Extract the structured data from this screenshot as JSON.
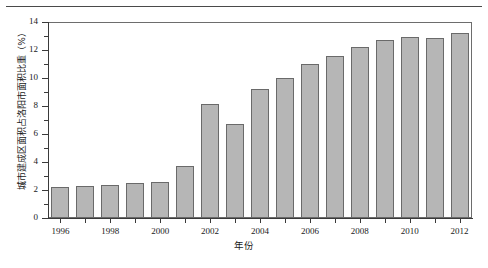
{
  "chart_data": {
    "type": "bar",
    "title": "",
    "xlabel": "年份",
    "ylabel": "城市建成区面积占洛阳市面积比重（%）",
    "categories": [
      1996,
      1997,
      1998,
      1999,
      2000,
      2001,
      2002,
      2003,
      2004,
      2005,
      2006,
      2007,
      2008,
      2009,
      2010,
      2011,
      2012
    ],
    "values": [
      2.25,
      2.3,
      2.35,
      2.5,
      2.55,
      3.7,
      8.15,
      6.75,
      9.2,
      10.0,
      11.0,
      11.6,
      12.25,
      12.75,
      12.9,
      12.85,
      13.2
    ],
    "xtick_labels": [
      "1996",
      "1998",
      "2000",
      "2002",
      "2004",
      "2006",
      "2008",
      "2010",
      "2012"
    ],
    "xtick_values": [
      1996,
      1998,
      2000,
      2002,
      2004,
      2006,
      2008,
      2010,
      2012
    ],
    "ytick_labels": [
      "0",
      "2",
      "4",
      "6",
      "8",
      "10",
      "12",
      "14"
    ],
    "ytick_values": [
      0,
      2,
      4,
      6,
      8,
      10,
      12,
      14
    ],
    "yminor_values": [
      1,
      3,
      5,
      7,
      9,
      11,
      13
    ],
    "ylim": [
      0,
      14
    ],
    "grid": false,
    "legend": null,
    "bar_color": "#b6b6b6",
    "bar_edge_color": "#6a6a6a",
    "axis_color": "#3a3a3a",
    "frame_color": "#6d6d6d",
    "background": "#ffffff"
  }
}
